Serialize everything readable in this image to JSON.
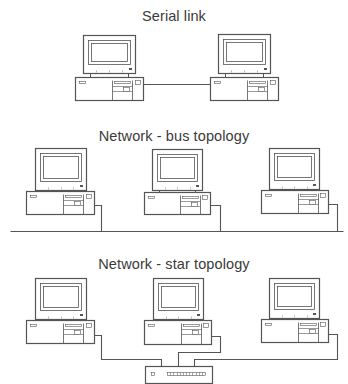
{
  "sections": [
    {
      "title": "Serial link",
      "topology": "serial",
      "title_y": 9,
      "computers": [
        {
          "monitor": [
            83,
            35,
            52,
            38
          ],
          "base": [
            75,
            77,
            68,
            23
          ]
        },
        {
          "monitor": [
            218,
            34,
            52,
            39
          ],
          "base": [
            210,
            77,
            68,
            23
          ]
        }
      ],
      "links": [
        {
          "points": [
            [
              143,
              84
            ],
            [
              210,
              84
            ]
          ]
        }
      ]
    },
    {
      "title": "Network - bus topology",
      "topology": "bus",
      "title_y": 129,
      "computers": [
        {
          "monitor": [
            35,
            148,
            51,
            42
          ],
          "base": [
            26,
            191,
            68,
            23
          ]
        },
        {
          "monitor": [
            152,
            149,
            50,
            41
          ],
          "base": [
            144,
            192,
            66,
            22
          ]
        },
        {
          "monitor": [
            269,
            148,
            50,
            41
          ],
          "base": [
            261,
            190,
            67,
            23
          ]
        }
      ],
      "links": [
        {
          "points": [
            [
              10,
              231
            ],
            [
              343,
              231
            ]
          ]
        },
        {
          "points": [
            [
              94,
              205
            ],
            [
              101,
              205
            ],
            [
              101,
              231
            ]
          ]
        },
        {
          "points": [
            [
              210,
              205
            ],
            [
              220,
              205
            ],
            [
              220,
              231
            ]
          ]
        },
        {
          "points": [
            [
              328,
              204
            ],
            [
              337,
              204
            ],
            [
              337,
              231
            ]
          ]
        }
      ]
    },
    {
      "title": "Network - star topology",
      "topology": "star",
      "title_y": 257,
      "computers": [
        {
          "monitor": [
            35,
            278,
            51,
            41
          ],
          "base": [
            26,
            320,
            68,
            23
          ]
        },
        {
          "monitor": [
            153,
            278,
            50,
            41
          ],
          "base": [
            144,
            320,
            67,
            24
          ]
        },
        {
          "monitor": [
            269,
            278,
            50,
            40
          ],
          "base": [
            261,
            319,
            67,
            23
          ]
        }
      ],
      "hub": {
        "rect": [
          145,
          366,
          67,
          17
        ]
      },
      "links": [
        {
          "points": [
            [
              94,
              335
            ],
            [
              101,
              335
            ],
            [
              101,
              359
            ],
            [
              161,
              359
            ],
            [
              161,
              366
            ]
          ]
        },
        {
          "points": [
            [
              211,
              336
            ],
            [
              220,
              336
            ],
            [
              220,
              352
            ],
            [
              178,
              352
            ],
            [
              178,
              366
            ]
          ]
        },
        {
          "points": [
            [
              328,
              334
            ],
            [
              337,
              334
            ],
            [
              337,
              359
            ],
            [
              194,
              359
            ],
            [
              194,
              366
            ]
          ]
        }
      ]
    }
  ],
  "colors": {
    "stroke": "#555555",
    "text": "#3a3a3a",
    "background": "#ffffff"
  }
}
